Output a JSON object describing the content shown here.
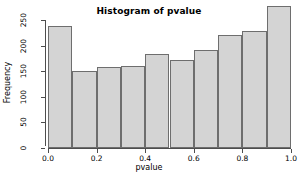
{
  "chart_data": {
    "type": "bar",
    "title": "Histogram of pvalue",
    "xlabel": "pvalue",
    "ylabel": "Frequency",
    "categories": [
      "0.0-0.1",
      "0.1-0.2",
      "0.2-0.3",
      "0.3-0.4",
      "0.4-0.5",
      "0.5-0.6",
      "0.6-0.7",
      "0.7-0.8",
      "0.8-0.9",
      "0.9-1.0"
    ],
    "bin_edges": [
      0.0,
      0.1,
      0.2,
      0.3,
      0.4,
      0.5,
      0.6,
      0.7,
      0.8,
      0.9,
      1.0
    ],
    "values": [
      238,
      150,
      158,
      160,
      184,
      171,
      192,
      221,
      228,
      278
    ],
    "xlim": [
      0.0,
      1.0
    ],
    "ylim": [
      0,
      280
    ],
    "xticks": [
      0.0,
      0.2,
      0.4,
      0.6,
      0.8,
      1.0
    ],
    "xtick_labels": [
      "0.0",
      "0.2",
      "0.4",
      "0.6",
      "0.8",
      "1.0"
    ],
    "yticks": [
      0,
      50,
      100,
      150,
      200,
      250
    ],
    "ytick_labels": [
      "0",
      "50",
      "100",
      "150",
      "200",
      "250"
    ],
    "grid": false,
    "legend": null,
    "bar_fill_color": "#d4d4d4",
    "bar_border_color": "#6e6e6e",
    "axis_color": "#4d4d4d",
    "background_color": "#ffffff"
  }
}
